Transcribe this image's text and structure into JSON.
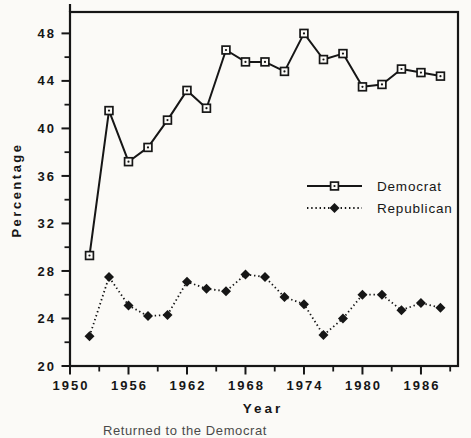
{
  "chart_data": {
    "type": "line",
    "title": "",
    "xlabel": "Year",
    "ylabel": "Percentage",
    "x": [
      1952,
      1954,
      1956,
      1958,
      1960,
      1962,
      1964,
      1966,
      1968,
      1970,
      1972,
      1974,
      1976,
      1978,
      1980,
      1982,
      1984,
      1986,
      1988
    ],
    "series": [
      {
        "name": "Democrat",
        "line_style": "solid",
        "marker": "open-square-with-dot",
        "values": [
          29.3,
          41.5,
          37.2,
          38.4,
          40.7,
          43.2,
          41.7,
          46.6,
          45.6,
          45.6,
          44.8,
          48.0,
          45.8,
          46.3,
          43.5,
          43.7,
          45.0,
          44.7,
          44.4
        ]
      },
      {
        "name": "Republican",
        "line_style": "dotted",
        "marker": "filled-diamond",
        "values": [
          22.5,
          27.5,
          25.1,
          24.2,
          24.3,
          27.1,
          26.5,
          26.3,
          27.7,
          27.5,
          25.8,
          25.2,
          22.6,
          24.0,
          26.0,
          26.0,
          24.7,
          25.3,
          24.9
        ]
      }
    ],
    "xlim": [
      1950,
      1989.8
    ],
    "ylim": [
      20,
      49.8
    ],
    "x_major_ticks": [
      1950,
      1956,
      1962,
      1968,
      1974,
      1980,
      1986
    ],
    "x_minor_ticks": [
      1953,
      1959,
      1965,
      1971,
      1977,
      1983,
      1989
    ],
    "y_major_ticks": [
      20,
      24,
      28,
      32,
      36,
      40,
      44,
      48
    ],
    "y_minor_ticks": [
      22,
      26,
      30,
      34,
      38,
      42,
      46
    ],
    "grid": false,
    "legend_position": "inside-middle-right"
  },
  "colors": {
    "ink": "#161616",
    "background": "#fbfaf7"
  },
  "footer_fragment": "Returned to the  Democrat"
}
